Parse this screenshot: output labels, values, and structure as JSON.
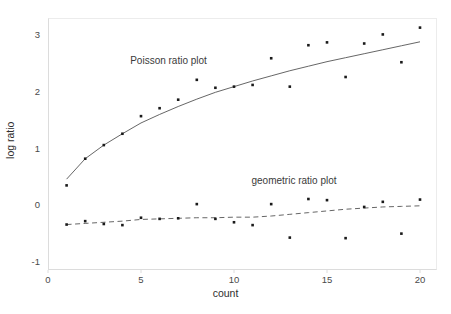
{
  "chart_data": {
    "type": "scatter",
    "title": "",
    "xlabel": "count",
    "ylabel": "log ratio",
    "xlim": [
      0,
      20.6
    ],
    "ylim": [
      -1,
      3.35
    ],
    "xticks": [
      0,
      5,
      10,
      15,
      20
    ],
    "yticks": [
      -1,
      0,
      1,
      2,
      3
    ],
    "xtick_labels": [
      "0",
      "5",
      "10",
      "15",
      "20"
    ],
    "ytick_labels": [
      "-1",
      "0",
      "1",
      "2",
      "3"
    ],
    "grid": false,
    "legend": "none",
    "x": [
      1,
      2,
      3,
      4,
      5,
      6,
      7,
      8,
      9,
      10,
      11,
      12,
      13,
      14,
      15,
      16,
      17,
      18,
      19,
      20
    ],
    "series": [
      {
        "name": "Poisson ratio plot",
        "marker": "square",
        "marker_color": "#1a1a1a",
        "line_style": "solid",
        "line_color": "#555555",
        "values": [
          0.35,
          0.82,
          1.06,
          1.26,
          1.57,
          1.71,
          1.86,
          2.21,
          2.07,
          2.09,
          2.12,
          2.59,
          2.09,
          2.82,
          2.87,
          2.26,
          2.85,
          3.01,
          2.52,
          3.13
        ],
        "fit": [
          0.46,
          0.82,
          1.06,
          1.26,
          1.45,
          1.6,
          1.74,
          1.87,
          1.99,
          2.09,
          2.19,
          2.28,
          2.37,
          2.45,
          2.53,
          2.6,
          2.67,
          2.74,
          2.81,
          2.88
        ]
      },
      {
        "name": "geometric ratio plot",
        "marker": "square",
        "marker_color": "#1a1a1a",
        "line_style": "dashed",
        "line_color": "#555555",
        "values": [
          -0.34,
          -0.28,
          -0.33,
          -0.35,
          -0.22,
          -0.24,
          -0.23,
          0.02,
          -0.24,
          -0.3,
          -0.35,
          0.02,
          -0.57,
          0.11,
          0.09,
          -0.58,
          -0.03,
          0.06,
          -0.5,
          0.1
        ],
        "fit": [
          -0.34,
          -0.32,
          -0.3,
          -0.28,
          -0.25,
          -0.24,
          -0.23,
          -0.22,
          -0.22,
          -0.21,
          -0.21,
          -0.19,
          -0.16,
          -0.13,
          -0.1,
          -0.07,
          -0.05,
          -0.03,
          -0.02,
          -0.01
        ]
      }
    ],
    "annotations": [
      {
        "text": "Poisson ratio plot",
        "x": 7.0,
        "y": 2.52
      },
      {
        "text": "geometric ratio plot",
        "x": 13.9,
        "y": 0.41
      }
    ]
  },
  "axes": {
    "x_title": "count",
    "y_title": "log ratio"
  },
  "colors": {
    "background": "#ffffff",
    "frame": "#dcdcdc",
    "marker": "#1a1a1a",
    "fit_line": "#555555",
    "text": "#3a3a3a"
  }
}
